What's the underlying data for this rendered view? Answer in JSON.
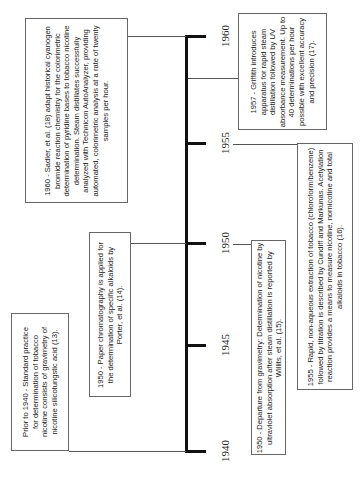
{
  "timeline": {
    "orientation": "vertical-rotated",
    "years": [
      "1960",
      "1955",
      "1950",
      "1945",
      "1940"
    ]
  },
  "events": [
    {
      "id": "sadler-1960",
      "year": "1960",
      "text": "1960 - Sadler, et al. (18) adapt historical cyanogen bromide reaction chemistry for the colorimetric determination of pyridine bases to tobacco nicotine determination.  Steam distillates successfully analyzed with Technicon AutoAnalyzer, providing automated, colorimetric analysis at a rate of twenty samples per hour."
    },
    {
      "id": "griffith-1957",
      "year": "1957",
      "text": "1957 - Griffith introduces apparatus for rapid steam distillation followed by UV absorbance measurement. Up to 40 determinations per hour possible with excellent accuracy and precision (17)."
    },
    {
      "id": "cundiff-1955",
      "year": "1955",
      "text": "1955 - Rapid, non-aqueous extraction of tobacco (chloroform/benzene) followed by titration is described by Cundiff and Markunas.  Acetylation reaction provides a means to measure nicotine, nornicotine and total alkaloids in tobacco (16)."
    },
    {
      "id": "porter-1950",
      "year": "1950",
      "text": "1950 - Paper chromatography is applied for the determination of specific alkaloids by Porter, et al. (14)."
    },
    {
      "id": "willits-1950",
      "year": "1950",
      "text": "1950 - Departure from gravimetry: Determination of nicotine by ultraviolet absorption after steam distillation is reported by Willits, et al. (15)."
    },
    {
      "id": "prior-1940",
      "year": "1940",
      "text": "Prior to 1940 - Standard practice for determination of tobacco nicotine consists of gravimetry of nicotine silicotungstic acid (13)."
    }
  ]
}
